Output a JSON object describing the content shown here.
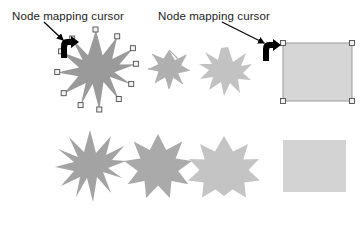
{
  "figure": {
    "width": 361,
    "height": 230,
    "background": "#ffffff"
  },
  "annotations": [
    {
      "id": "left",
      "label": "Node mapping cursor",
      "text_color": "#1a1a1a",
      "leader_line": {
        "x1": 44,
        "y1": 22,
        "x2": 64,
        "y2": 41,
        "color": "#000000"
      },
      "points_to": "node-mapping-cursor-left"
    },
    {
      "id": "right",
      "label": "Node mapping cursor",
      "text_color": "#1a1a1a",
      "leader_line": {
        "x1": 222,
        "y1": 22,
        "x2": 266,
        "y2": 44,
        "color": "#000000"
      },
      "points_to": "node-mapping-cursor-right"
    }
  ],
  "cursors": [
    {
      "id": "node-mapping-cursor-left",
      "x": 60,
      "y": 36,
      "color": "#000000",
      "type": "node-mapping"
    },
    {
      "id": "node-mapping-cursor-right",
      "x": 262,
      "y": 39,
      "color": "#000000",
      "type": "node-mapping"
    }
  ],
  "colors": {
    "star_dark": "#9a9a9a",
    "star_mid": "#a8a8a8",
    "star_light": "#c6c6c6",
    "square_fill": "#d6d6d6",
    "square_stroke": "#9b9b9b",
    "handle_fill": "#f2f2f2",
    "handle_stroke": "#4d4d4d",
    "selection_stroke": "#8c8c8c"
  },
  "top_row": [
    {
      "name": "selected-spiky-star",
      "shape": "star",
      "points": 11,
      "fill": "#9a9a9a",
      "selected": true,
      "node_handles": 22,
      "center": {
        "x": 96,
        "y": 70
      },
      "outer_radius": 40,
      "inner_radius": 17
    },
    {
      "name": "twisted-star-small",
      "shape": "star-twisted",
      "points": 11,
      "fill": "#a8a8a8",
      "selected": false,
      "center": {
        "x": 169,
        "y": 70
      },
      "outer_radius": 20,
      "inner_radius": 10,
      "twist": 55
    },
    {
      "name": "irregular-jagged-blob",
      "shape": "star-irregular",
      "points": 11,
      "fill": "#c2c2c2",
      "selected": false,
      "center": {
        "x": 227,
        "y": 72
      },
      "outer_radius": 25,
      "inner_radius": 14
    },
    {
      "name": "selected-square",
      "shape": "square",
      "fill": "#d6d6d6",
      "stroke": "#9b9b9b",
      "selected": true,
      "node_handles": 4,
      "x": 283,
      "y": 43,
      "width": 69,
      "height": 58
    }
  ],
  "bottom_row": [
    {
      "name": "spiky-star-long-points",
      "shape": "star",
      "points": 11,
      "fill": "#a3a3a3",
      "selected": false,
      "center": {
        "x": 90,
        "y": 166
      },
      "outer_radius": 36,
      "inner_radius": 15
    },
    {
      "name": "star-medium-points",
      "shape": "star",
      "points": 11,
      "fill": "#aaaaaa",
      "selected": false,
      "center": {
        "x": 158,
        "y": 166
      },
      "outer_radius": 32,
      "inner_radius": 19
    },
    {
      "name": "star-blunt-points",
      "shape": "star",
      "points": 11,
      "fill": "#c4c4c4",
      "selected": false,
      "center": {
        "x": 224,
        "y": 166
      },
      "outer_radius": 30,
      "inner_radius": 24
    },
    {
      "name": "plain-square",
      "shape": "square",
      "fill": "#d3d3d3",
      "selected": false,
      "x": 283,
      "y": 140,
      "width": 63,
      "height": 52
    }
  ]
}
